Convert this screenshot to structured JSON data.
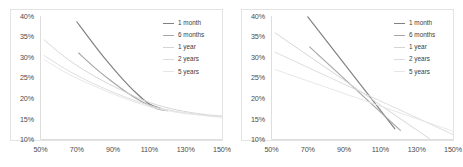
{
  "figure": {
    "panel_count": 2,
    "background": "#ffffff",
    "frame_color": "#e3e3e3"
  },
  "series_style": {
    "names": [
      "1 month",
      "6 months",
      "1 year",
      "2 years",
      "5 years"
    ],
    "colors": [
      "#808080",
      "#a6a6a6",
      "#d4d4d4",
      "#dcdcdc",
      "#e6e6e6"
    ]
  },
  "chart_data": [
    {
      "type": "line",
      "title": "",
      "subtitle": "",
      "xlabel": "",
      "ylabel": "",
      "panel": "left",
      "grid": false,
      "legend_position": "top-right",
      "xlim": [
        50,
        150
      ],
      "ylim": [
        10,
        40
      ],
      "xticks": [
        50,
        70,
        90,
        110,
        130,
        150
      ],
      "yticks": [
        10,
        15,
        20,
        25,
        30,
        35,
        40
      ],
      "xtick_labels": [
        "50%",
        "70%",
        "90%",
        "110%",
        "130%",
        "150%"
      ],
      "ytick_labels": [
        "10%",
        "15%",
        "20%",
        "25%",
        "30%",
        "35%",
        "40%"
      ],
      "shape": "convex-decay",
      "series": [
        {
          "name": "1 month",
          "color": "#808080",
          "x": [
            70,
            78,
            86,
            94,
            102,
            110,
            116
          ],
          "values": [
            38.6,
            33.9,
            29.4,
            25.3,
            21.6,
            18.6,
            17.6
          ]
        },
        {
          "name": "6 months",
          "color": "#a6a6a6",
          "x": [
            71,
            80,
            89,
            98,
            107,
            114,
            120
          ],
          "values": [
            31.0,
            27.4,
            24.2,
            21.3,
            18.9,
            17.5,
            17.0
          ]
        },
        {
          "name": "1 year",
          "color": "#d4d4d4",
          "x": [
            52,
            65,
            80,
            95,
            110,
            125,
            140,
            150
          ],
          "values": [
            34.2,
            29.5,
            25.3,
            21.9,
            19.0,
            17.2,
            16.1,
            15.7
          ]
        },
        {
          "name": "2 years",
          "color": "#dcdcdc",
          "x": [
            52,
            65,
            80,
            95,
            110,
            125,
            140,
            150
          ],
          "values": [
            30.4,
            26.8,
            23.4,
            20.6,
            18.3,
            16.8,
            15.9,
            15.5
          ]
        },
        {
          "name": "5 years",
          "color": "#e6e6e6",
          "x": [
            52,
            65,
            80,
            95,
            110,
            125,
            140,
            150
          ],
          "values": [
            29.4,
            26.0,
            22.9,
            20.2,
            18.0,
            16.6,
            15.8,
            15.4
          ]
        }
      ]
    },
    {
      "type": "line",
      "title": "",
      "subtitle": "",
      "xlabel": "",
      "ylabel": "",
      "panel": "right",
      "grid": false,
      "legend_position": "top-right",
      "xlim": [
        50,
        150
      ],
      "ylim": [
        10,
        40
      ],
      "xticks": [
        50,
        70,
        90,
        110,
        130,
        150
      ],
      "yticks": [
        10,
        15,
        20,
        25,
        30,
        35,
        40
      ],
      "xtick_labels": [
        "50%",
        "70%",
        "90%",
        "110%",
        "130%",
        "150%"
      ],
      "ytick_labels": [
        "10%",
        "15%",
        "20%",
        "25%",
        "30%",
        "35%",
        "40%"
      ],
      "shape": "straight-crossing",
      "series": [
        {
          "name": "1 month",
          "color": "#808080",
          "x": [
            70,
            118
          ],
          "values": [
            39.8,
            12.6
          ]
        },
        {
          "name": "6 months",
          "color": "#a6a6a6",
          "x": [
            71,
            121
          ],
          "values": [
            32.5,
            12.2
          ]
        },
        {
          "name": "1 year",
          "color": "#d4d4d4",
          "x": [
            52,
            137
          ],
          "values": [
            35.9,
            10.2
          ]
        },
        {
          "name": "2 years",
          "color": "#dcdcdc",
          "x": [
            52,
            150
          ],
          "values": [
            31.2,
            11.2
          ]
        },
        {
          "name": "5 years",
          "color": "#e6e6e6",
          "x": [
            52,
            150
          ],
          "values": [
            27.0,
            12.0
          ]
        }
      ]
    }
  ]
}
